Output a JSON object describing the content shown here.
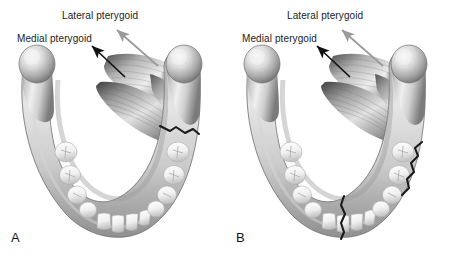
{
  "figure": {
    "background_color": "#ffffff",
    "width": 450,
    "height": 261,
    "type": "medical-illustration"
  },
  "panels": [
    {
      "letter": "A",
      "labels": {
        "lateral": "Lateral pterygoid",
        "medial": "Medial pterygoid"
      },
      "fractures": [
        {
          "name": "right-angle-fracture",
          "region": "right mandibular angle"
        }
      ]
    },
    {
      "letter": "B",
      "labels": {
        "lateral": "Lateral pterygoid",
        "medial": "Medial pterygoid"
      },
      "fractures": [
        {
          "name": "right-body-fracture",
          "region": "right mandibular body"
        },
        {
          "name": "symphysis-fracture",
          "region": "mandibular symphysis midline"
        }
      ]
    }
  ],
  "colors": {
    "bone_light": "#f2f2f2",
    "bone_mid": "#b8b8b8",
    "bone_dark": "#6e6e6e",
    "tooth_light": "#fbfbfb",
    "tooth_shadow": "#c9c9c9",
    "muscle_light": "#e8e8e8",
    "muscle_dark": "#5c5c5c",
    "fracture_line": "#1a1a1a",
    "arrow_medial": "#111111",
    "arrow_lateral": "#9a9a9a",
    "text": "#1b1b1b"
  }
}
